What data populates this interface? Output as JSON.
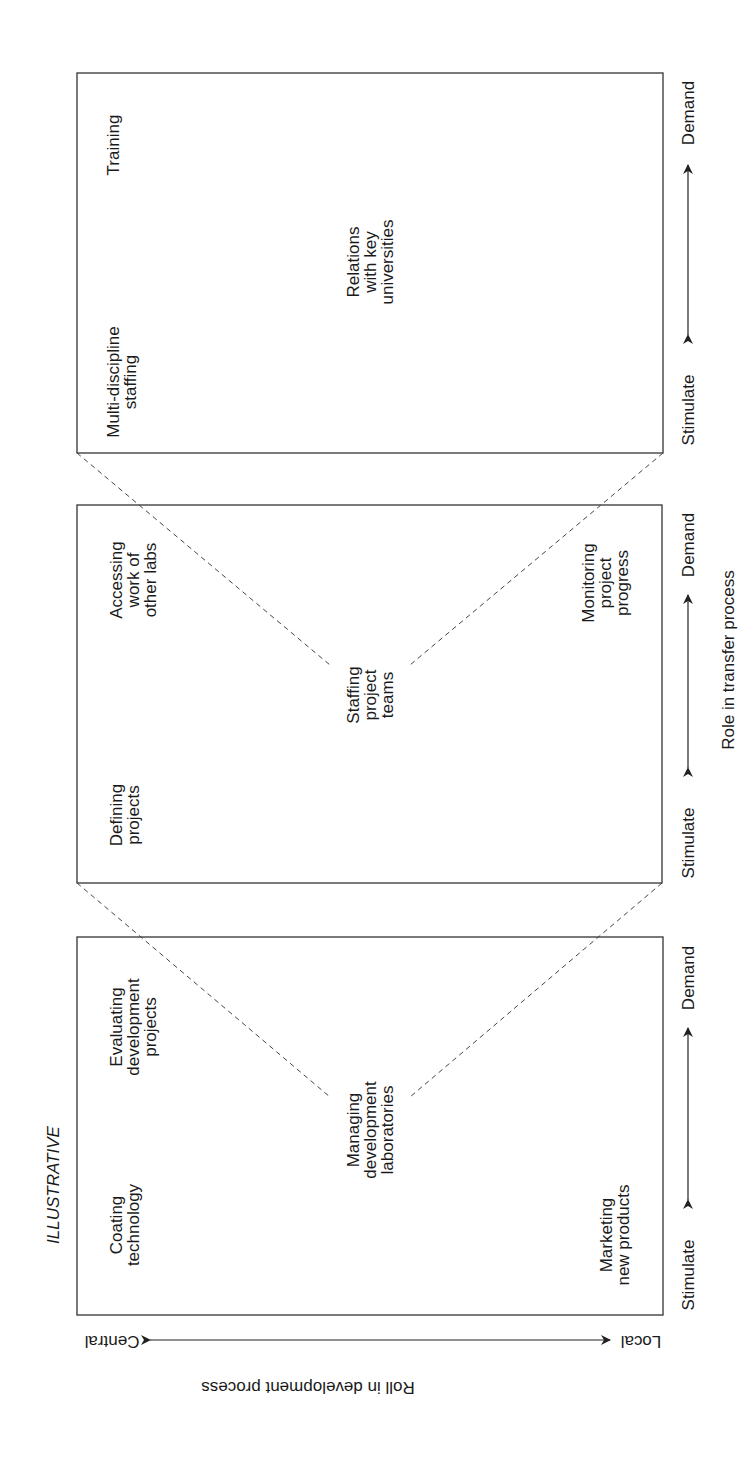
{
  "diagram": {
    "stamp": "ILLUSTRATIVE",
    "colors": {
      "line": "#333333",
      "text": "#1a1a1a",
      "background": "#ffffff"
    },
    "transfer_axis": {
      "title": "Role in transfer process",
      "low_label": "Stimulate",
      "high_label": "Demand"
    },
    "development_axis": {
      "title": "Roll in development process",
      "low_label": "Central",
      "high_label": "Local"
    },
    "panels": [
      {
        "name": "Managing development laboratories",
        "center": "Managing\ndevelopment\nlaboratories",
        "central_stimulate": "Coating\ntechnology",
        "central_demand": "Evaluating\ndevelopment\nprojects",
        "local_stimulate": "Marketing\nnew products",
        "stimulate": "Stimulate",
        "demand": "Demand"
      },
      {
        "name": "Staffing project teams",
        "center": "Staffing\nproject\nteams",
        "central_stimulate": "Defining\nprojects",
        "central_demand": "Accessing\nwork of\nother labs",
        "local_demand": "Monitoring\nproject\nprogress",
        "stimulate": "Stimulate",
        "demand": "Demand"
      },
      {
        "name": "Relations with key universities",
        "center": "Relations\nwith key\nuniversities",
        "central_stimulate": "Multi-discipline\nstaffing",
        "central_demand": "Training",
        "stimulate": "Stimulate",
        "demand": "Demand"
      }
    ]
  }
}
